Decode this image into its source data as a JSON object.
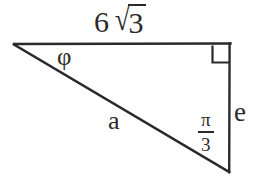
{
  "figure": {
    "type": "right-triangle-geometry-diagram",
    "background_color": "#ffffff",
    "stroke_color": "#2a2a2a",
    "text_color": "#2a2a2a",
    "width": 255,
    "height": 180,
    "vertices": {
      "left": [
        14,
        44
      ],
      "top_right": [
        230,
        43
      ],
      "bottom_right": [
        229,
        172
      ]
    },
    "labels": {
      "top_side": {
        "coefficient": "6",
        "radical_sign": "√",
        "radicand": "3",
        "full_text": "6√3"
      },
      "angle_phi": "φ",
      "hypotenuse": "a",
      "vertical_side": "e",
      "angle_fraction": {
        "numerator": "π",
        "denominator": "3",
        "full_text": "π/3"
      }
    },
    "markers": {
      "right_angle_square": {
        "at_vertex": "top_right",
        "size": 17
      }
    }
  }
}
